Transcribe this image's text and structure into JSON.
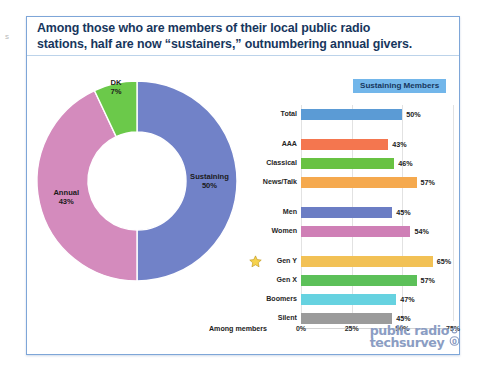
{
  "edge_artifact": "s",
  "slide": {
    "title": "Among those who are members of their local public radio\nstations, half are now “sustainers,” outnumbering annual givers.",
    "axis_note": "Among members",
    "legend_label": "Sustaining Members"
  },
  "logo": {
    "line1": "public radio",
    "line2": "techsurvey"
  },
  "icons": {
    "star": "star-icon",
    "logo_mark": "logo-circle-icon"
  },
  "colors": {
    "title": "#17365d",
    "slide_border": "#7ea6d8",
    "legend_chip": "#72b6ea",
    "logo": "#8b9dc3",
    "donut_sustaining": "#7182c8",
    "donut_annual": "#d48bbd",
    "donut_dk": "#6bc94a",
    "bar_total": "#5b9bd5",
    "bar_aaa": "#f4764f",
    "bar_classical": "#68c242",
    "bar_newstalk": "#f5a94e",
    "bar_men": "#6b7dc4",
    "bar_women": "#cf7fb6",
    "bar_geny": "#f2c155",
    "bar_genx": "#5cc059",
    "bar_boomers": "#66d2e0",
    "bar_silent": "#9b9b9b"
  },
  "chart_data": [
    {
      "type": "pie",
      "title": "Membership type",
      "labels": [
        "Sustaining",
        "Annual",
        "DK"
      ],
      "values": [
        50,
        43,
        7
      ],
      "value_labels": [
        "50%",
        "43%",
        "7%"
      ],
      "colors": [
        "#7182c8",
        "#d48bbd",
        "#6bc94a"
      ],
      "donut": true,
      "legend": "none"
    },
    {
      "type": "bar",
      "orientation": "horizontal",
      "title": "Sustaining Members",
      "xlabel": "",
      "ylabel": "",
      "xlim": [
        0,
        75
      ],
      "ticks": [
        "0%",
        "25%",
        "50%",
        "75%"
      ],
      "tick_values": [
        0,
        25,
        50,
        75
      ],
      "grid": true,
      "categories": [
        "Total",
        "AAA",
        "Classical",
        "News/Talk",
        "Men",
        "Women",
        "Gen Y",
        "Gen X",
        "Boomers",
        "Silent"
      ],
      "values": [
        50,
        43,
        46,
        57,
        45,
        54,
        65,
        57,
        47,
        45
      ],
      "value_labels": [
        "50%",
        "43%",
        "46%",
        "57%",
        "45%",
        "54%",
        "65%",
        "57%",
        "47%",
        "45%"
      ],
      "bar_colors": [
        "#5b9bd5",
        "#f4764f",
        "#68c242",
        "#f5a94e",
        "#6b7dc4",
        "#cf7fb6",
        "#f2c155",
        "#5cc059",
        "#66d2e0",
        "#9b9b9b"
      ],
      "highlight": "Gen Y",
      "groups": [
        [
          "Total"
        ],
        [
          "AAA",
          "Classical",
          "News/Talk"
        ],
        [
          "Men",
          "Women"
        ],
        [
          "Gen Y",
          "Gen X",
          "Boomers",
          "Silent"
        ]
      ]
    }
  ]
}
